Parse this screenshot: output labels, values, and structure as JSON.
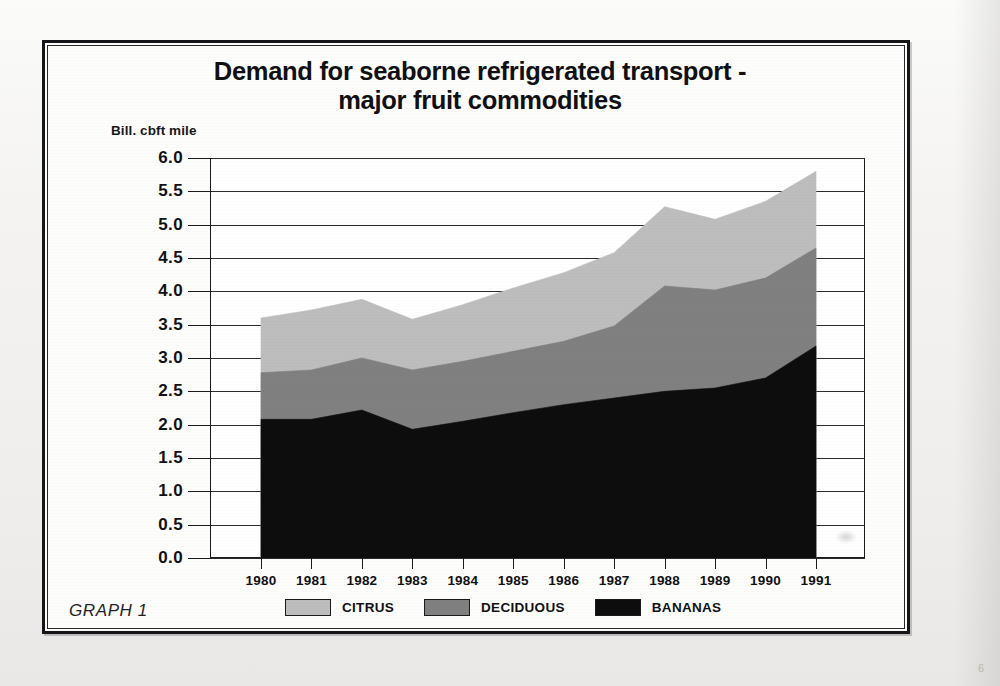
{
  "figure": {
    "title_line1": "Demand for seaborne refrigerated transport -",
    "title_line2": "major fruit commodities",
    "caption": "GRAPH 1",
    "y_units": "Bill. cbft mile"
  },
  "legend": {
    "items": [
      {
        "label": "CITRUS",
        "color": "#bdbdbd",
        "name": "citrus"
      },
      {
        "label": "DECIDUOUS",
        "color": "#808080",
        "name": "deciduous"
      },
      {
        "label": "BANANAS",
        "color": "#0d0d0d",
        "name": "bananas"
      }
    ]
  },
  "chart_data": {
    "type": "area",
    "stacked": true,
    "title": "Demand for seaborne refrigerated transport - major fruit commodities",
    "xlabel": "",
    "ylabel": "Bill. cbft mile",
    "ylim": [
      0.0,
      6.0
    ],
    "xlim": [
      1980,
      1991
    ],
    "grid": true,
    "legend_position": "bottom",
    "categories": [
      1980,
      1981,
      1982,
      1983,
      1984,
      1985,
      1986,
      1987,
      1988,
      1989,
      1990,
      1991
    ],
    "x_tick_labels": [
      "1980",
      "1981",
      "1982",
      "1983",
      "1984",
      "1985",
      "1986",
      "1987",
      "1988",
      "1989",
      "1990",
      "1991"
    ],
    "y_tick_labels": [
      "6.0",
      "5.5",
      "5.0",
      "4.5",
      "4.0",
      "3.5",
      "3.0",
      "2.5",
      "2.0",
      "1.5",
      "1.0",
      "0.5",
      "0.0"
    ],
    "y_ticks": [
      6.0,
      5.5,
      5.0,
      4.5,
      4.0,
      3.5,
      3.0,
      2.5,
      2.0,
      1.5,
      1.0,
      0.5,
      0.0
    ],
    "series": [
      {
        "name": "BANANAS",
        "color": "#0d0d0d",
        "values": [
          2.08,
          2.08,
          2.22,
          1.93,
          2.05,
          2.18,
          2.3,
          2.4,
          2.5,
          2.55,
          2.7,
          3.18
        ]
      },
      {
        "name": "DECIDUOUS",
        "color": "#808080",
        "values": [
          0.7,
          0.74,
          0.78,
          0.89,
          0.9,
          0.92,
          0.95,
          1.08,
          1.58,
          1.47,
          1.5,
          1.47
        ]
      },
      {
        "name": "CITRUS",
        "color": "#bdbdbd",
        "values": [
          0.82,
          0.9,
          0.88,
          0.76,
          0.85,
          0.95,
          1.03,
          1.1,
          1.19,
          1.06,
          1.15,
          1.15
        ]
      }
    ],
    "cumulative_tops": {
      "BANANAS": [
        2.08,
        2.08,
        2.22,
        1.93,
        2.05,
        2.18,
        2.3,
        2.4,
        2.5,
        2.55,
        2.7,
        3.18
      ],
      "DECIDUOUS": [
        2.78,
        2.82,
        3.0,
        2.82,
        2.95,
        3.1,
        3.25,
        3.48,
        4.08,
        4.02,
        4.2,
        4.65
      ],
      "CITRUS": [
        3.6,
        3.72,
        3.88,
        3.58,
        3.8,
        4.05,
        4.28,
        4.58,
        5.27,
        5.08,
        5.35,
        5.8
      ]
    }
  }
}
